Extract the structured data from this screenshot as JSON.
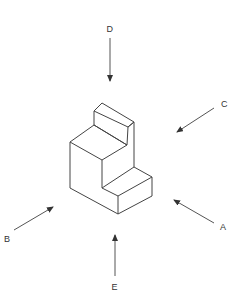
{
  "diagram": {
    "line_color": "#444444",
    "arrows": [
      {
        "label": "D",
        "direction": "top"
      },
      {
        "label": "C",
        "direction": "right-upper"
      },
      {
        "label": "A",
        "direction": "right-lower"
      },
      {
        "label": "B",
        "direction": "left-lower"
      },
      {
        "label": "E",
        "direction": "bottom"
      }
    ]
  }
}
